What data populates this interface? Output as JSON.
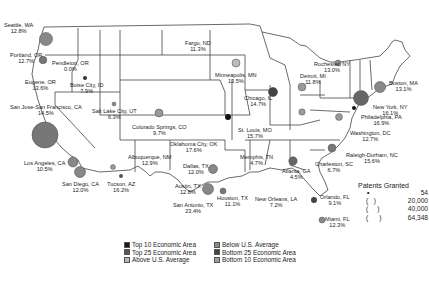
{
  "map": {
    "title": "",
    "colors": {
      "top10": "#1a1a1a",
      "top25": "#555555",
      "above_avg": "#b0b0b0",
      "below_avg": "#8a8a8a",
      "bottom25": "#666666",
      "bottom10": "#9a9a9a"
    },
    "cities": [
      {
        "name": "Seattle, WA",
        "value": "12.8%"
      },
      {
        "name": "Portland, OR",
        "value": "12.7%"
      },
      {
        "name": "Pendleton, OR",
        "value": "0.0%"
      },
      {
        "name": "Eugene, OR",
        "value": "13.6%"
      },
      {
        "name": "Boise City, ID",
        "value": "7.9%"
      },
      {
        "name": "San Jose-San Francisco, CA",
        "value": "14.5%"
      },
      {
        "name": "Salt Lake City, UT",
        "value": "6.3%"
      },
      {
        "name": "Los Angeles, CA",
        "value": "10.5%"
      },
      {
        "name": "San Diego, CA",
        "value": "12.0%"
      },
      {
        "name": "Tucson, AZ",
        "value": "16.2%"
      },
      {
        "name": "Colorado Springs, CO",
        "value": "9.7%"
      },
      {
        "name": "Albuquerque, NM",
        "value": "12.9%"
      },
      {
        "name": "Fargo, ND",
        "value": "11.3%"
      },
      {
        "name": "Minneapolis, MN",
        "value": "13.5%"
      },
      {
        "name": "Chicago, IL",
        "value": "14.7%"
      },
      {
        "name": "St. Louis, MO",
        "value": "15.7%"
      },
      {
        "name": "Oklahoma City, OK",
        "value": "17.6%"
      },
      {
        "name": "Dallas, TX",
        "value": "12.0%"
      },
      {
        "name": "Austin, TX",
        "value": "12.8%"
      },
      {
        "name": "San Antonio, TX",
        "value": "23.4%"
      },
      {
        "name": "Houston, TX",
        "value": "11.1%"
      },
      {
        "name": "New Orleans, LA",
        "value": "7.2%"
      },
      {
        "name": "Memphis, TN",
        "value": "4.7%"
      },
      {
        "name": "Atlanta, GA",
        "value": "4.5%"
      },
      {
        "name": "Charleston, SC",
        "value": "6.7%"
      },
      {
        "name": "Orlando, FL",
        "value": "9.1%"
      },
      {
        "name": "Miami, FL",
        "value": "12.3%"
      },
      {
        "name": "Raleigh-Durham, NC",
        "value": "15.6%"
      },
      {
        "name": "Washington, DC",
        "value": "12.7%"
      },
      {
        "name": "Philadelphia, PA",
        "value": "16.9%"
      },
      {
        "name": "New York, NY",
        "value": "16.1%"
      },
      {
        "name": "Boston, MA",
        "value": "13.1%"
      },
      {
        "name": "Rochester, NY",
        "value": "13.0%"
      },
      {
        "name": "Detroit, MI",
        "value": "11.8%"
      }
    ]
  },
  "legend": {
    "categories": [
      {
        "label": "Top 10 Economic Area",
        "color": "#1a1a1a"
      },
      {
        "label": "Top 25 Economic Area",
        "color": "#555555"
      },
      {
        "label": "Above U.S. Average",
        "color": "#b8b8b8"
      },
      {
        "label": "Below U.S. Average",
        "color": "#8a8a8a"
      },
      {
        "label": "Bottom 25 Economic Area",
        "color": "#444444"
      },
      {
        "label": "Bottom 10 Economic Area",
        "color": "#a0a0a0"
      }
    ],
    "size": {
      "title": "Patents Granted",
      "values": [
        "54",
        "20,000",
        "40,000",
        "64,348"
      ]
    }
  }
}
